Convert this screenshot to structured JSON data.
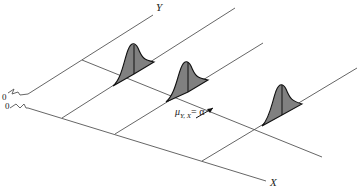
{
  "diagram": {
    "type": "3d-regression-illustration",
    "axes": {
      "y_label": "Y",
      "x_label": "X",
      "origin_labels": [
        "0",
        "0"
      ]
    },
    "annotation": {
      "mu": "μ",
      "subscript": "Y, X",
      "rhs": "= α"
    },
    "distributions": [
      {
        "name": "normal-curve-1",
        "shape": "bell"
      },
      {
        "name": "normal-curve-2",
        "shape": "bell"
      },
      {
        "name": "normal-curve-3",
        "shape": "bell"
      }
    ],
    "colors": {
      "line": "#555555",
      "fill": "#808080",
      "outline": "#111111"
    }
  }
}
